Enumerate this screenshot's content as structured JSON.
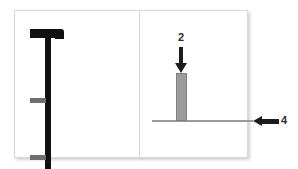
{
  "figure": {
    "background_color": "#ffffff",
    "panels": [
      {
        "name": "left-panel",
        "content": "black T-shaped post with two gray tick marks"
      },
      {
        "name": "right-panel",
        "content": "gray vertical bar on a horizontal baseline with callout arrows"
      }
    ]
  },
  "annotations": [
    {
      "label": "2",
      "arrow_direction": "down",
      "points_to": "gray vertical bar",
      "color": "#1b1b1b"
    },
    {
      "label": "4",
      "arrow_direction": "left",
      "points_to": "horizontal baseline",
      "color": "#1b1b1b"
    }
  ],
  "labels": {
    "callout_2": "2",
    "callout_4": "4"
  },
  "colors": {
    "post": "#111111",
    "tick": "#6e6e6e",
    "bar_fill": "#9c9c9c",
    "bar_stroke": "#7e7e7e",
    "baseline": "#9a9a9a",
    "arrow": "#1b1b1b",
    "panel_border": "#d8d8d8"
  },
  "chart_data": {
    "type": "bar",
    "title": "",
    "xlabel": "",
    "ylabel": "",
    "categories": [
      "2"
    ],
    "values": [
      48
    ],
    "annotations": [
      "2",
      "4"
    ],
    "grid": false,
    "legend": "none"
  }
}
